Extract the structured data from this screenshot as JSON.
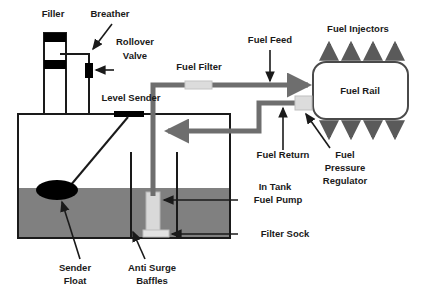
{
  "diagram": {
    "colors": {
      "outline": "#1a1a1a",
      "fuel_fill": "#808080",
      "pipe": "#6e6e6e",
      "component_light": "#d9d9d9",
      "component_dark": "#000000",
      "background": "#ffffff"
    },
    "labels": [
      {
        "id": "filler",
        "text": "Filler",
        "x": 53,
        "y": 17,
        "anchor": "middle"
      },
      {
        "id": "breather",
        "text": "Breather",
        "x": 110,
        "y": 17,
        "anchor": "middle"
      },
      {
        "id": "rollover",
        "text": "Rollover",
        "x": 135,
        "y": 45,
        "anchor": "middle"
      },
      {
        "id": "valve",
        "text": "Valve",
        "x": 135,
        "y": 59,
        "anchor": "middle"
      },
      {
        "id": "level-sender",
        "text": "Level Sender",
        "x": 131,
        "y": 101,
        "anchor": "middle"
      },
      {
        "id": "fuel-filter",
        "text": "Fuel Filter",
        "x": 199,
        "y": 70,
        "anchor": "middle"
      },
      {
        "id": "fuel-feed",
        "text": "Fuel Feed",
        "x": 270,
        "y": 43,
        "anchor": "middle"
      },
      {
        "id": "fuel-injectors",
        "text": "Fuel Injectors",
        "x": 358,
        "y": 32,
        "anchor": "middle"
      },
      {
        "id": "fuel-rail",
        "text": "Fuel Rail",
        "x": 360,
        "y": 91,
        "anchor": "middle"
      },
      {
        "id": "fuel-return",
        "text": "Fuel Return",
        "x": 283,
        "y": 158,
        "anchor": "middle"
      },
      {
        "id": "fuel-pressure-1",
        "text": "Fuel",
        "x": 345,
        "y": 158,
        "anchor": "middle"
      },
      {
        "id": "fuel-pressure-2",
        "text": "Pressure",
        "x": 345,
        "y": 171,
        "anchor": "middle"
      },
      {
        "id": "fuel-pressure-3",
        "text": "Regulator",
        "x": 345,
        "y": 184,
        "anchor": "middle"
      },
      {
        "id": "in-tank",
        "text": "In Tank",
        "x": 275,
        "y": 190,
        "anchor": "middle"
      },
      {
        "id": "fuel-pump",
        "text": "Fuel Pump",
        "x": 278,
        "y": 203,
        "anchor": "middle"
      },
      {
        "id": "filter-sock",
        "text": "Filter Sock",
        "x": 285,
        "y": 237,
        "anchor": "middle"
      },
      {
        "id": "sender-float-1",
        "text": "Sender",
        "x": 75,
        "y": 271,
        "anchor": "middle"
      },
      {
        "id": "sender-float-2",
        "text": "Float",
        "x": 75,
        "y": 284,
        "anchor": "middle"
      },
      {
        "id": "anti-surge-1",
        "text": "Anti Surge",
        "x": 152,
        "y": 271,
        "anchor": "middle"
      },
      {
        "id": "anti-surge-2",
        "text": "Baffles",
        "x": 152,
        "y": 284,
        "anchor": "middle"
      }
    ],
    "components": {
      "tank": {
        "x": 18,
        "y": 114,
        "width": 212,
        "height": 124
      },
      "fuel_level_y": 188,
      "filler_neck": {
        "x": 44,
        "y": 33,
        "width": 22,
        "height": 81
      },
      "filler_cap_height": 9,
      "filler_band_y": 60,
      "rollover_valve": {
        "x": 85,
        "y": 63,
        "width": 8,
        "height": 15
      },
      "level_sender_bar": {
        "x": 114,
        "y": 111,
        "width": 30,
        "height": 6
      },
      "sender_float": {
        "cx": 57,
        "cy": 190,
        "rx": 21,
        "ry": 10
      },
      "fuel_pump": {
        "x": 146,
        "y": 192,
        "width": 14,
        "height": 42
      },
      "filter_sock": {
        "x": 143,
        "y": 230,
        "width": 26,
        "height": 7
      },
      "baffle_left_x": 131,
      "baffle_right_x": 177,
      "fuel_rail": {
        "x": 313,
        "y": 62,
        "width": 95,
        "height": 57
      },
      "pressure_regulator": {
        "x": 295,
        "y": 96,
        "width": 17,
        "height": 14
      },
      "fuel_filter_block": {
        "x": 185,
        "y": 81,
        "width": 27,
        "height": 8
      },
      "injector_count": 4
    }
  }
}
